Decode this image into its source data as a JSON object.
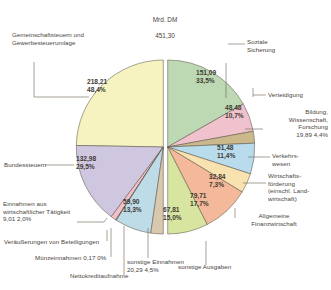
{
  "title": {
    "unit": "Mrd. DM",
    "total": "451,30"
  },
  "chart_data": {
    "type": "pie",
    "title": "Mrd. DM 451,30",
    "subtitle": "Bundeshaushalt: Einnahmen und Ausgaben",
    "unit": "Mrd. DM",
    "total": 451.3,
    "legend": "none",
    "grid": false,
    "halves": [
      {
        "name": "Einnahmen",
        "side": "left",
        "slices": [
          {
            "label": "Gemeinschaftsteuern und Gewerbesteuerumlage",
            "value": "218,21",
            "percent": "48,4%",
            "num": 218.21,
            "pct": 48.4,
            "color": "#f6f3c0"
          },
          {
            "label": "Bundessteuern",
            "value": "132,98",
            "percent": "29,5%",
            "num": 132.98,
            "pct": 29.5,
            "color": "#cfc6e0"
          },
          {
            "label": "Einnahmen aus wirtschaftlicher Tätigkeit",
            "value": "9,01",
            "percent": "2,0%",
            "num": 9.01,
            "pct": 2.0,
            "color": "#f2bfc9"
          },
          {
            "label": "Veräußerungen von Beteiligungen",
            "value": "",
            "percent": "",
            "num": 0.9,
            "pct": 0.2,
            "color": "#f2e07a"
          },
          {
            "label": "Münzeinnahmen",
            "value": "0,17",
            "percent": "0%",
            "num": 0.17,
            "pct": 0.0,
            "color": "#8c8c6a"
          },
          {
            "label": "Nettokreditaufnahme",
            "value": "59,90",
            "percent": "13,3%",
            "num": 59.9,
            "pct": 13.3,
            "color": "#bedbe8"
          },
          {
            "label": "sonstige Einnahmen",
            "value": "20,29",
            "percent": "4,5%",
            "num": 20.29,
            "pct": 4.5,
            "color": "#d8c8ae"
          }
        ]
      },
      {
        "name": "Ausgaben",
        "side": "right",
        "slices": [
          {
            "label": "Soziale Sicherung",
            "value": "151,09",
            "percent": "33,5%",
            "num": 151.09,
            "pct": 33.5,
            "color": "#bdd9b4"
          },
          {
            "label": "Verteidigung",
            "value": "48,48",
            "percent": "10,7%",
            "num": 48.48,
            "pct": 10.7,
            "color": "#efc2cd"
          },
          {
            "label": "Bildung, Wissenschaft, Forschung",
            "value": "19,89",
            "percent": "4,4%",
            "num": 19.89,
            "pct": 4.4,
            "color": "#cbb98c"
          },
          {
            "label": "Verkehrswesen",
            "value": "51,48",
            "percent": "11,4%",
            "num": 51.48,
            "pct": 11.4,
            "color": "#b9dced"
          },
          {
            "label": "Wirtschaftsförderung (einschl. Landwirtschaft)",
            "value": "32,84",
            "percent": "7,3%",
            "num": 32.84,
            "pct": 7.3,
            "color": "#f7e2b0"
          },
          {
            "label": "Allgemeine Finanzwirtschaft",
            "value": "79,71",
            "percent": "17,7%",
            "num": 79.71,
            "pct": 17.7,
            "color": "#f3b99a"
          },
          {
            "label": "sonstige Ausgaben",
            "value": "67,81",
            "percent": "15,0%",
            "num": 67.81,
            "pct": 15.0,
            "color": "#d7e5a0"
          }
        ]
      }
    ]
  },
  "labels": {
    "left": {
      "gemeinschaftsteuern": "Gemeinschaftsteuern und\nGewerbesteuerumlage",
      "gemeinschaftsteuern_val": "218,21\n48,4%",
      "bundessteuern": "Bundessteuern",
      "bundessteuern_val": "132,98\n29,5%",
      "wirtschaftliche_taetigkeit": "Einnahmen aus\nwirtschaftlicher Tätigkeit\n9,01   2,0%",
      "veraeusserungen": "Veräußerungen von Beteiligungen",
      "muenzeinnahmen": "Münzeinnahmen  0,17  0%",
      "nettokreditaufnahme": "Nettokreditaufnahme",
      "nettokreditaufnahme_val": "59,90\n13,3%",
      "sonstige_einnahmen": "sonstige Einnahmen\n20,29   4,5%"
    },
    "right": {
      "soziale_sicherung": "Soziale\nSicherung",
      "soziale_sicherung_val": "151,09\n33,5%",
      "verteidigung": "Verteidigung",
      "verteidigung_val": "48,48\n10,7%",
      "bildung": "Bildung,\nWissenschaft,\nForschung\n19,89   4,4%",
      "verkehrswesen": "Verkehrs-\nwesen",
      "verkehrswesen_val": "51,48\n11,4%",
      "wirtschaftsfoerderung": "Wirtschafts-\nförderung\n(einschl. Land-\nwirtschaft)",
      "wirtschaftsfoerderung_val": "32,84\n7,3%",
      "finanzwirtschaft": "Allgemeine\nFinanzwirtschaft",
      "finanzwirtschaft_val": "79,71\n17,7%",
      "sonstige_ausgaben": "sonstige Ausgaben",
      "sonstige_ausgaben_val": "67,81\n15,0%"
    }
  }
}
